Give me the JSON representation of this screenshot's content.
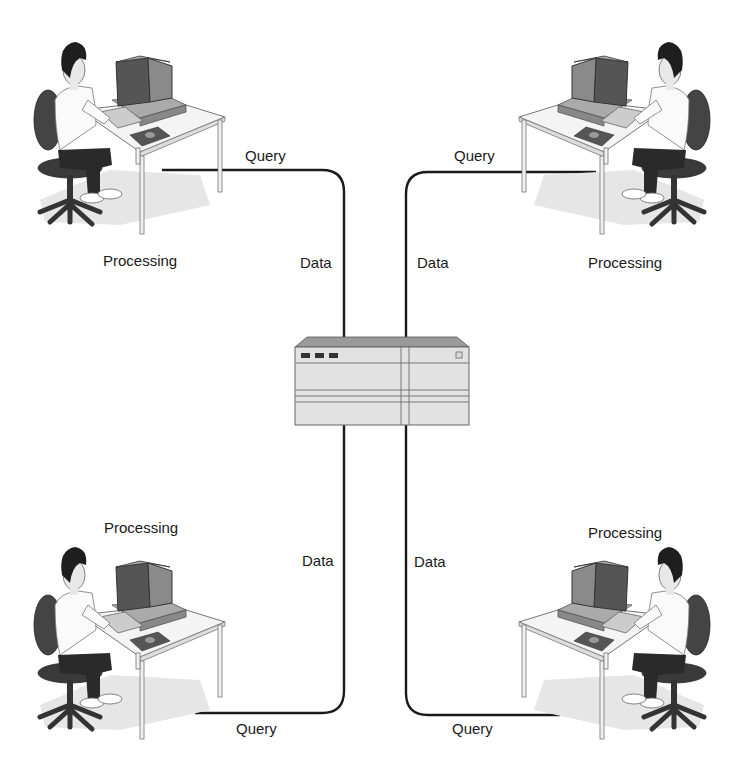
{
  "diagram": {
    "type": "client-server",
    "server": {
      "name": "server",
      "icon": "server-icon"
    },
    "clients": [
      {
        "position": "top-left",
        "processing_label": "Processing",
        "query_label": "Query",
        "data_label": "Data"
      },
      {
        "position": "top-right",
        "processing_label": "Processing",
        "query_label": "Query",
        "data_label": "Data"
      },
      {
        "position": "bottom-left",
        "processing_label": "Processing",
        "query_label": "Query",
        "data_label": "Data"
      },
      {
        "position": "bottom-right",
        "processing_label": "Processing",
        "query_label": "Query",
        "data_label": "Data"
      }
    ],
    "colors": {
      "line": "#1a1a1a",
      "server_face": "#e2e2e2",
      "server_top": "#9a9a9a",
      "monitor": "#7a7a7a",
      "screen": "#555555",
      "chair": "#444444",
      "pants": "#2a2a2a",
      "hair": "#1e1e1e",
      "desk": "#f4f4f4",
      "shadow": "#e6e6e6"
    }
  }
}
